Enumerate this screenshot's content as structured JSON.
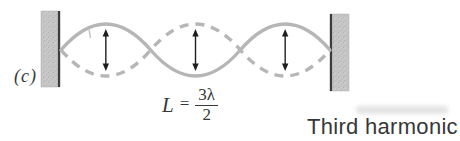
{
  "figure": {
    "panel_label": "(c)",
    "formula": {
      "lhs": "L",
      "eq": "=",
      "num": "3λ",
      "den": "2"
    },
    "caption": "Third harmonic",
    "wave": {
      "loops": 3,
      "x_start": 61,
      "x_end": 330,
      "axis_y": 50,
      "amplitude": 26,
      "arrow_half_span": 21
    },
    "walls": [
      {
        "side": "left",
        "x": 41,
        "y": 11,
        "w": 19,
        "h": 76,
        "edge": "right"
      },
      {
        "side": "right",
        "x": 330,
        "y": 14,
        "w": 19,
        "h": 77,
        "edge": "left"
      }
    ],
    "colors": {
      "background": "#ffffff",
      "wave": "#b6b6b6",
      "wall_fill": "#c9c9c9",
      "wall_speckle": "#a8a8a8",
      "wall_edge": "#3c3c3c",
      "arrow": "#1e1e1e",
      "text": "#373737"
    }
  }
}
